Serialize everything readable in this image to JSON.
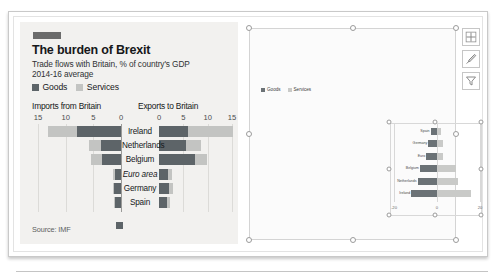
{
  "infographic": {
    "kicker_bar": "#6b6b6b",
    "title": "The burden of Brexit",
    "subtitle": "Trade flows with Britain, % of country's GDP",
    "subtitle2": "2014-16 average",
    "source": "Source: IMF",
    "legend": [
      {
        "label": "Goods",
        "color": "#5d6468"
      },
      {
        "label": "Services",
        "color": "#c3c4c2"
      }
    ],
    "left_axis_title": "Imports from Britain",
    "right_axis_title": "Exports to Britain",
    "left_ticks": [
      "15",
      "10",
      "5",
      "0"
    ],
    "right_ticks": [
      "0",
      "5",
      "10",
      "15"
    ]
  },
  "chart_data": {
    "type": "bar",
    "orientation": "horizontal",
    "layout": "butterfly",
    "title": "The burden of Brexit",
    "subtitle": "Trade flows with Britain, % of country's GDP",
    "note": "2014-16 average",
    "xlabel": "",
    "ylabel": "",
    "grid": true,
    "legend_position": "top-left",
    "categories": [
      "Ireland",
      "Netherlands",
      "Belgium",
      "Euro area",
      "Germany",
      "Spain"
    ],
    "panels": [
      {
        "name": "Imports from Britain",
        "xlim": [
          0,
          15
        ],
        "ticks": [
          15,
          10,
          5,
          0
        ],
        "direction": "left",
        "series": [
          {
            "name": "Goods",
            "color": "#5d6468",
            "values": [
              8.0,
              3.6,
              3.5,
              1.1,
              1.2,
              1.0
            ]
          },
          {
            "name": "Services",
            "color": "#c3c4c2",
            "values": [
              5.2,
              2.1,
              1.9,
              0.4,
              0.3,
              0.3
            ]
          }
        ]
      },
      {
        "name": "Exports to Britain",
        "xlim": [
          0,
          15
        ],
        "ticks": [
          0,
          5,
          10,
          15
        ],
        "direction": "right",
        "series": [
          {
            "name": "Goods",
            "color": "#5d6468",
            "values": [
              6.0,
              5.6,
              7.4,
              1.8,
              2.0,
              1.7
            ]
          },
          {
            "name": "Services",
            "color": "#c3c4c2",
            "values": [
              9.3,
              3.0,
              2.4,
              0.9,
              0.8,
              0.5
            ]
          }
        ]
      }
    ]
  },
  "chart_object": {
    "legend": [
      {
        "label": "Goods",
        "color": "#6b7276"
      },
      {
        "label": "Services",
        "color": "#c9cac8"
      }
    ],
    "mini_chart": {
      "type": "bar",
      "orientation": "horizontal",
      "xlim": [
        -20,
        20
      ],
      "ticks": [
        "-20",
        "0",
        "20"
      ],
      "categories": [
        "Spain",
        "Germany",
        "Euro",
        "Belgium",
        "Netherlands",
        "Ireland"
      ],
      "series": [
        {
          "name": "Goods",
          "color": "#6b7276",
          "values": [
            -3,
            -4,
            -5,
            -8,
            -9,
            -12
          ]
        },
        {
          "name": "Services",
          "color": "#c9cac8",
          "values": [
            2,
            3,
            3,
            9,
            10,
            16
          ]
        }
      ]
    }
  },
  "toolbar": {
    "buttons": [
      {
        "name": "chart-elements",
        "label": "Chart Elements"
      },
      {
        "name": "chart-styles",
        "label": "Chart Styles"
      },
      {
        "name": "chart-filters",
        "label": "Chart Filters"
      }
    ]
  }
}
